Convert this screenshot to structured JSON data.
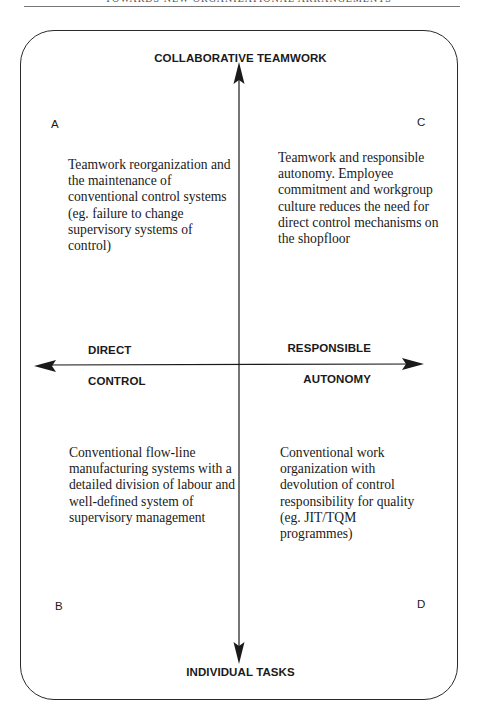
{
  "page": {
    "running_header": "TOWARDS NEW ORGANIZATIONAL ARRANGEMENTS"
  },
  "diagram": {
    "type": "2x2 matrix",
    "vertical_axis": {
      "top_label": "COLLABORATIVE TEAMWORK",
      "bottom_label": "INDIVIDUAL TASKS"
    },
    "horizontal_axis": {
      "left_label_line1": "DIRECT",
      "left_label_line2": "CONTROL",
      "right_label_line1": "RESPONSIBLE",
      "right_label_line2": "AUTONOMY"
    },
    "quadrants": {
      "A": {
        "letter": "A",
        "position": "top-left",
        "text": "Teamwork reorganization and the maintenance of conventional control systems (eg. failure to change supervisory systems of control)"
      },
      "B": {
        "letter": "B",
        "position": "bottom-left",
        "text": "Conventional flow-line manufacturing systems with a detailed division of labour and well-defined system of supervisory management"
      },
      "C": {
        "letter": "C",
        "position": "top-right",
        "text": "Teamwork and responsible autonomy. Employee commitment and workgroup culture reduces the need for direct control mechanisms on the shopfloor"
      },
      "D": {
        "letter": "D",
        "position": "bottom-right",
        "text": "Conventional work organization with devolution of control responsibility for quality (eg. JIT/TQM programmes)"
      }
    },
    "colors": {
      "ink": "#1a1a1a",
      "frame": "#2a2a2a",
      "background": "#ffffff"
    }
  }
}
